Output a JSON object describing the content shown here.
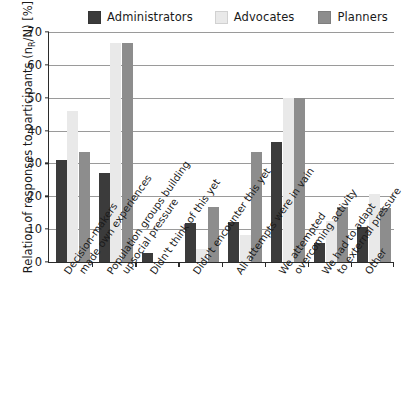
{
  "chart_data": {
    "type": "bar",
    "title": "",
    "subtitle": "",
    "xlabel": "",
    "ylabel": "Relation of responses to participants (nR/N) [%]",
    "ylabel_parts": {
      "main": "Relation of responses to participants (n",
      "sub": "R",
      "tail": "/N) [%]"
    },
    "ylim": [
      0,
      70
    ],
    "yticks": [
      0,
      10,
      20,
      30,
      40,
      50,
      60,
      70
    ],
    "ytick_labels": [
      "0",
      "10",
      "20",
      "30",
      "40",
      "50",
      "60",
      "70"
    ],
    "grid": "horizontal",
    "legend_position": "top",
    "categories": [
      "Decision-makers made own experiences",
      "Population groups building upsocial pressure",
      "Didn't think of this yet",
      "Didn't encounter this yet",
      "All attempts were in vain",
      "We attempted overcoming activity",
      "We had to adapt to external pressure",
      "Other"
    ],
    "category_lines": [
      [
        "Decision-makers",
        "made own experiences"
      ],
      [
        "Population groups building",
        "upsocial pressure"
      ],
      [
        "Didn't think of this yet",
        ""
      ],
      [
        "Didn't encounter this yet",
        ""
      ],
      [
        "All attempts were in vain",
        ""
      ],
      [
        "We attempted",
        "overcoming activity"
      ],
      [
        "We had to adapt",
        "to external pressure"
      ],
      [
        "Other",
        ""
      ]
    ],
    "series": [
      {
        "name": "Administrators",
        "color": "#3b3b3b",
        "values": [
          31.2,
          27.0,
          2.6,
          11.8,
          12.3,
          36.6,
          5.9,
          10.7
        ]
      },
      {
        "name": "Advocates",
        "color": "#e9e9e9",
        "values": [
          46.0,
          66.8,
          0.0,
          4.1,
          8.2,
          50.0,
          12.4,
          20.7
        ]
      },
      {
        "name": "Planners",
        "color": "#8d8d8d",
        "values": [
          33.5,
          66.8,
          0.0,
          16.6,
          33.4,
          50.0,
          16.6,
          16.5
        ]
      }
    ]
  },
  "legend": {
    "items": [
      {
        "label": "Administrators",
        "color": "#3b3b3b"
      },
      {
        "label": "Advocates",
        "color": "#e9e9e9"
      },
      {
        "label": "Planners",
        "color": "#8d8d8d"
      }
    ]
  }
}
